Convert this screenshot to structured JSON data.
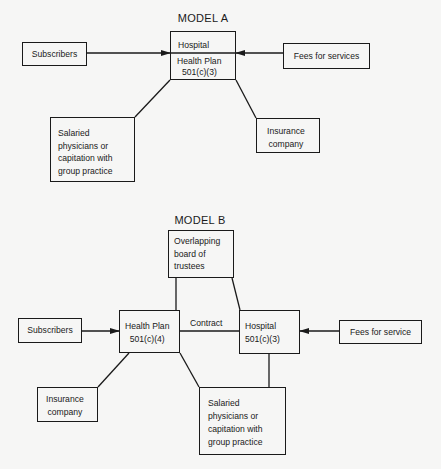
{
  "model_a": {
    "title": "MODEL A",
    "subscribers": "Subscribers",
    "center_top": "Hospital",
    "center_bottom_line1": "Health Plan",
    "center_bottom_line2": "501(c)(3)",
    "fees": "Fees for services",
    "salaried": "Salaried\nphysicians or\ncapitation with\ngroup practice",
    "insurance": "Insurance\ncompany"
  },
  "model_b": {
    "title": "MODEL B",
    "trustees": "Overlapping\nboard of\ntrustees",
    "subscribers": "Subscribers",
    "health_plan": "Health Plan\n501(c)(4)",
    "contract_label": "Contract",
    "hospital": "Hospital\n501(c)(3)",
    "fees": "Fees for service",
    "insurance": "Insurance\ncompany",
    "salaried": "Salaried\nphysicians or\ncapitation with\ngroup practice"
  },
  "colors": {
    "ink": "#1a1a1a",
    "paper": "#f6f6f5"
  }
}
